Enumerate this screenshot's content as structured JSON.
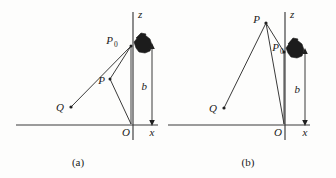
{
  "figure": {
    "background_color": "#fdfdfc",
    "ink_color": "#3a3a3a",
    "blob_color": "#1c1c1c"
  },
  "panels": [
    {
      "id": "a",
      "caption": "(a)",
      "axes": {
        "vertical_label": "z",
        "horizontal_label": "x",
        "origin_label": "O"
      },
      "dimension": {
        "label": "b",
        "description": "height of P0 above the x axis, double headed arrow"
      },
      "points": [
        {
          "name": "P_0",
          "label": "P",
          "subscript": "0"
        },
        {
          "name": "P",
          "label": "P",
          "subscript": ""
        },
        {
          "name": "Q",
          "label": "Q",
          "subscript": ""
        }
      ],
      "blob": {
        "name": "charge-distribution-blob"
      }
    },
    {
      "id": "b",
      "caption": "(b)",
      "axes": {
        "vertical_label": "z",
        "horizontal_label": "x",
        "origin_label": "O"
      },
      "dimension": {
        "label": "b",
        "description": "height of P0 above the x axis, double headed arrow"
      },
      "points": [
        {
          "name": "P",
          "label": "P",
          "subscript": ""
        },
        {
          "name": "P_0",
          "label": "P",
          "subscript": "0"
        },
        {
          "name": "Q",
          "label": "Q",
          "subscript": ""
        }
      ],
      "blob": {
        "name": "charge-distribution-blob"
      }
    }
  ]
}
